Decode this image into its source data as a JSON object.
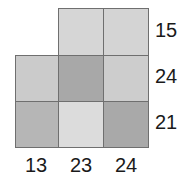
{
  "figure": {
    "kind": "shaded-grid-sum-puzzle",
    "grid_rows": 3,
    "grid_cols": 3
  },
  "chart_data": {
    "type": "heatmap",
    "title": "",
    "xlabel": "",
    "ylabel": "",
    "grid": true,
    "legend": "none",
    "categories": [
      "col1",
      "col2",
      "col3"
    ],
    "row_categories": [
      "row1",
      "row2",
      "row3"
    ],
    "column_totals": [
      13,
      23,
      24
    ],
    "row_totals": [
      15,
      24,
      21
    ],
    "cells": [
      [
        {
          "present": false,
          "shade": null,
          "row": 0,
          "col": 0
        },
        {
          "present": true,
          "shade": "#d6d6d6",
          "row": 0,
          "col": 1
        },
        {
          "present": true,
          "shade": "#d4d4d4",
          "row": 0,
          "col": 2
        }
      ],
      [
        {
          "present": true,
          "shade": "#cbcbcb",
          "row": 1,
          "col": 0
        },
        {
          "present": true,
          "shade": "#a8a8a8",
          "row": 1,
          "col": 1
        },
        {
          "present": true,
          "shade": "#cdcdcd",
          "row": 1,
          "col": 2
        }
      ],
      [
        {
          "present": true,
          "shade": "#b6b6b6",
          "row": 2,
          "col": 0
        },
        {
          "present": true,
          "shade": "#dcdcdc",
          "row": 2,
          "col": 1
        },
        {
          "present": true,
          "shade": "#a9a9a9",
          "row": 2,
          "col": 2
        }
      ]
    ]
  },
  "labels": {
    "row_totals": [
      {
        "value": "15"
      },
      {
        "value": "24"
      },
      {
        "value": "21"
      }
    ],
    "column_totals": [
      {
        "value": "13"
      },
      {
        "value": "23"
      },
      {
        "value": "24"
      }
    ]
  },
  "colors": {
    "background": "#ffffff",
    "cell_border": "#6f6f6f",
    "label_text": "#1a1a1a"
  }
}
